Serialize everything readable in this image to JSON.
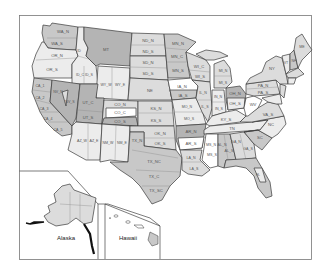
{
  "map": {
    "type": "US climate divisions map",
    "insets": [
      {
        "name": "alaska",
        "label": "Alaska"
      },
      {
        "name": "hawaii",
        "label": "Hawaii"
      }
    ],
    "labels": {
      "WA_N": "WA_N",
      "WA_S": "WA_S",
      "OR_N": "OR_N",
      "OR_S": "OR_S",
      "ID_N": "ID",
      "ID_C": "ID_C",
      "ID_S": "ID_S",
      "MT": "MT",
      "CA_1": "CA_1",
      "CA_2": "CA_2",
      "CA_3": "CA_3",
      "CA_4": "CA_4",
      "CA_5": "CA_5",
      "NV_N": "NV_N",
      "NV_S": "NV_S",
      "UT_C": "UT_C",
      "UT_S": "UT_S",
      "WY_W": "WY_W",
      "WY_E": "WY_E",
      "CO_N": "CO_N",
      "CO_C": "CO_C",
      "CO_S": "CO_S",
      "AZ_W": "AZ_W",
      "AZ_E": "AZ_E",
      "NM_W": "NM_W",
      "NM_E": "NM_E",
      "ND_N": "ND_N",
      "ND_S": "ND_S",
      "SD_N": "SD_N",
      "SD_S": "SD_S",
      "NE": "NE",
      "KS_N": "KS_N",
      "KS_S": "KS_S",
      "OK_N": "OK_N",
      "OK_S": "OK_S",
      "TX_N": "TX_N",
      "TX_NC": "TX_NC",
      "TX_C": "TX_C",
      "TX_SC": "TX_SC",
      "MN_N": "MN_N",
      "MN_C": "MN_C",
      "MN_S": "MN_S",
      "IA_N": "IA_N",
      "IA_S": "IA_S",
      "MO_N": "MO_N",
      "MO_S": "MO_S",
      "AR_N": "AR_N",
      "AR_S": "AR_S",
      "LA_N": "LA_N",
      "LA_S": "LA_S",
      "WI_C": "WI_C",
      "WI_S": "WI_S",
      "IL_N": "IL_N",
      "IL_S": "IL_S",
      "MI_N": "MI_N",
      "MI_S": "MI_S",
      "IN_N": "IN_N",
      "IN_S": "IN_S",
      "OH_N": "OH_N",
      "OH_S": "OH_S",
      "KY_S": "KY_S",
      "TN": "TN",
      "MS_N": "MS_N",
      "MS_S": "MS_S",
      "AL_N": "AL_N",
      "AL_S": "AL_S",
      "GA_N": "GA_N",
      "GA_S": "GA_S",
      "SC": "SC",
      "NC": "NC",
      "VA_S": "VA_S",
      "WV": "WV",
      "PA_N": "PA_N",
      "PA_S": "PA_S",
      "NY": "NY",
      "ME": "ME",
      "VT": "VT",
      "NH": "NH",
      "FL": "FL"
    },
    "colors": {
      "frame": "#777777",
      "state_border": "#3a3a3a",
      "dark": "#b4b4b4",
      "mid": "#c8c8c8",
      "light": "#dcdcdc",
      "pale": "#ececec",
      "white": "#ffffff"
    }
  }
}
